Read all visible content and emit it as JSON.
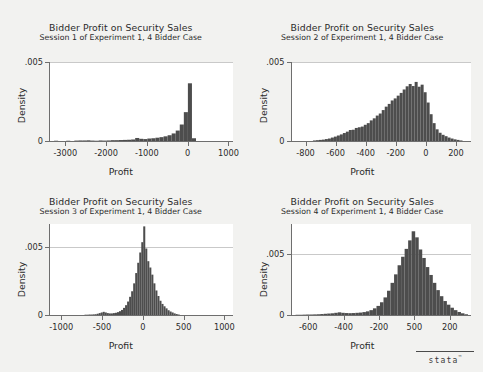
{
  "figure": {
    "background_color": "#f2f2f0",
    "plot_background_color": "#ffffff",
    "bar_color": "#4d4d4d",
    "axis_color": "#6e6e6e",
    "gridline_color": "#c9c9c9"
  },
  "logo": {
    "wordmark": "stata",
    "trademark": "™"
  },
  "chart_data": [
    {
      "type": "bar",
      "panel": 1,
      "title": "Bidder Profit on Security Sales",
      "subtitle": "Session 1 of Experiment 1, 4 Bidder Case",
      "xlabel": "Profit",
      "ylabel": "Density",
      "xlim": [
        -3400,
        1100
      ],
      "ylim": [
        0,
        0.00575
      ],
      "xticks": [
        -3000,
        -2000,
        -1000,
        0,
        1000
      ],
      "xticklabels": [
        "-3000",
        "-2000",
        "-1000",
        "0",
        "1000"
      ],
      "yticks": [
        0,
        0.005
      ],
      "yticklabels": [
        "0",
        ".005"
      ],
      "grid": true,
      "bin_width": 100,
      "bin_centers": [
        -3250,
        -3150,
        -3050,
        -2950,
        -2850,
        -2750,
        -2650,
        -2550,
        -2450,
        -2350,
        -2250,
        -2150,
        -2050,
        -1950,
        -1850,
        -1750,
        -1650,
        -1550,
        -1450,
        -1350,
        -1250,
        -1150,
        -1050,
        -950,
        -850,
        -750,
        -650,
        -550,
        -450,
        -350,
        -250,
        -150,
        -50,
        50,
        150
      ],
      "values": [
        2e-05,
        0,
        0,
        2e-05,
        0,
        3e-05,
        4e-05,
        4e-05,
        5e-05,
        3e-05,
        2e-05,
        4e-05,
        3e-05,
        4e-05,
        6e-05,
        6e-05,
        7e-05,
        8e-05,
        9e-05,
        0.00011,
        0.00022,
        0.00016,
        0.00014,
        0.00018,
        0.0002,
        0.00024,
        0.00028,
        0.00034,
        0.00042,
        0.00055,
        0.00076,
        0.0012,
        0.0021,
        0.0042,
        0.0002
      ]
    },
    {
      "type": "bar",
      "panel": 2,
      "title": "Bidder Profit on Security Sales",
      "subtitle": "Session 2 of Experiment 1, 4 Bidder Case",
      "xlabel": "Profit",
      "ylabel": "Density",
      "xlim": [
        -900,
        300
      ],
      "ylim": [
        0,
        0.00575
      ],
      "xticks": [
        -800,
        -600,
        -400,
        -200,
        0,
        200
      ],
      "xticklabels": [
        "-800",
        "-600",
        "-400",
        "-200",
        "0",
        "200"
      ],
      "yticks": [
        0,
        0.005
      ],
      "yticklabels": [
        "0",
        ".005"
      ],
      "grid": true,
      "bin_width": 20,
      "bin_centers": [
        -870,
        -850,
        -830,
        -810,
        -790,
        -770,
        -750,
        -730,
        -710,
        -690,
        -670,
        -650,
        -630,
        -610,
        -590,
        -570,
        -550,
        -530,
        -510,
        -490,
        -470,
        -450,
        -430,
        -410,
        -390,
        -370,
        -350,
        -330,
        -310,
        -290,
        -270,
        -250,
        -230,
        -210,
        -190,
        -170,
        -150,
        -130,
        -110,
        -90,
        -70,
        -50,
        -30,
        -10,
        10,
        30,
        50,
        70,
        90,
        110,
        130,
        150,
        170,
        190,
        210,
        230
      ],
      "values": [
        0,
        0,
        0,
        0,
        0,
        0,
        4e-05,
        6e-05,
        8e-05,
        0.0001,
        0.00014,
        0.00018,
        0.00025,
        0.00032,
        0.0004,
        0.00048,
        0.00058,
        0.00068,
        0.0008,
        0.00082,
        0.00095,
        0.001,
        0.00105,
        0.00118,
        0.0013,
        0.0015,
        0.00165,
        0.00185,
        0.002,
        0.00225,
        0.0025,
        0.0027,
        0.00295,
        0.0031,
        0.0033,
        0.0035,
        0.00375,
        0.00398,
        0.00415,
        0.004,
        0.0043,
        0.00395,
        0.0041,
        0.00355,
        0.0028,
        0.00195,
        0.0013,
        0.00085,
        0.0006,
        0.00045,
        0.00035,
        0.00025,
        0.00018,
        0.00012,
        8e-05,
        4e-05
      ]
    },
    {
      "type": "bar",
      "panel": 3,
      "title": "Bidder Profit on Security Sales",
      "subtitle": "Session 3 of Experiment 1, 4 Bidder Case",
      "xlabel": "Profit",
      "ylabel": "Density",
      "xlim": [
        -1150,
        1100
      ],
      "ylim": [
        0,
        0.00575
      ],
      "xticks": [
        -1000,
        -500,
        0,
        500,
        1000
      ],
      "xticklabels": [
        "-1000",
        "-500",
        "0",
        "500",
        "1000"
      ],
      "yticks": [
        0,
        0.005
      ],
      "yticklabels": [
        "0",
        ".005"
      ],
      "grid": true,
      "bin_width": 25,
      "bin_centers": [
        -712,
        -687,
        -662,
        -637,
        -612,
        -587,
        -562,
        -537,
        -512,
        -487,
        -462,
        -437,
        -412,
        -387,
        -362,
        -337,
        -312,
        -287,
        -262,
        -237,
        -212,
        -187,
        -162,
        -137,
        -112,
        -87,
        -62,
        -37,
        -12,
        12,
        37,
        62,
        87,
        112,
        137,
        162,
        187,
        212,
        237,
        262,
        287,
        312,
        337,
        362,
        387,
        412,
        437
      ],
      "values": [
        2e-05,
        2e-05,
        3e-05,
        3e-05,
        4e-05,
        5e-05,
        8e-05,
        0.00012,
        0.00016,
        0.0002,
        0.00016,
        0.00012,
        0.0001,
        0.0001,
        0.00012,
        0.00014,
        0.00018,
        0.00024,
        0.00032,
        0.00045,
        0.00062,
        0.00085,
        0.00115,
        0.0015,
        0.002,
        0.00265,
        0.0033,
        0.00395,
        0.0046,
        0.0056,
        0.0042,
        0.0034,
        0.003,
        0.00255,
        0.002,
        0.00155,
        0.0012,
        0.0009,
        0.0007,
        0.00055,
        0.00042,
        0.0003,
        0.00022,
        0.00016,
        0.0001,
        6e-05,
        3e-05
      ]
    },
    {
      "type": "bar",
      "panel": 4,
      "title": "Bidder Profit on Security Sales",
      "subtitle": "Session 4 of Experiment 1, 4 Bidder Case",
      "xlabel": "Profit",
      "ylabel": "Density",
      "xlim": [
        -700,
        320
      ],
      "ylim": [
        0,
        0.0075
      ],
      "xticks": [
        -600,
        -400,
        -200,
        0,
        200
      ],
      "xticklabels": [
        "-600",
        "-400",
        "-200",
        "500",
        "200"
      ],
      "yticks": [
        0,
        0.005
      ],
      "yticklabels": [
        "0",
        ".005"
      ],
      "grid": true,
      "bin_width": 20,
      "bin_centers": [
        -670,
        -650,
        -630,
        -610,
        -590,
        -570,
        -550,
        -530,
        -510,
        -490,
        -470,
        -450,
        -430,
        -410,
        -390,
        -370,
        -350,
        -330,
        -310,
        -290,
        -270,
        -250,
        -230,
        -210,
        -190,
        -170,
        -150,
        -130,
        -110,
        -90,
        -70,
        -50,
        -30,
        -10,
        10,
        30,
        50,
        70,
        90,
        110,
        130,
        150,
        170,
        190,
        210,
        230,
        250,
        270,
        290
      ],
      "values": [
        2e-05,
        2e-05,
        3e-05,
        4e-05,
        4e-05,
        5e-05,
        6e-05,
        8e-05,
        0.0001,
        0.00012,
        0.00014,
        0.00018,
        0.00022,
        0.00018,
        0.00016,
        0.00015,
        0.00016,
        0.00018,
        0.0002,
        0.00024,
        0.0003,
        0.0004,
        0.00055,
        0.00075,
        0.00105,
        0.00145,
        0.002,
        0.00265,
        0.00335,
        0.0041,
        0.0048,
        0.00545,
        0.00615,
        0.0069,
        0.0064,
        0.0054,
        0.0047,
        0.00395,
        0.0033,
        0.00265,
        0.00205,
        0.00155,
        0.00115,
        0.00085,
        0.0006,
        0.0004,
        0.00025,
        0.00014,
        6e-05
      ]
    }
  ]
}
